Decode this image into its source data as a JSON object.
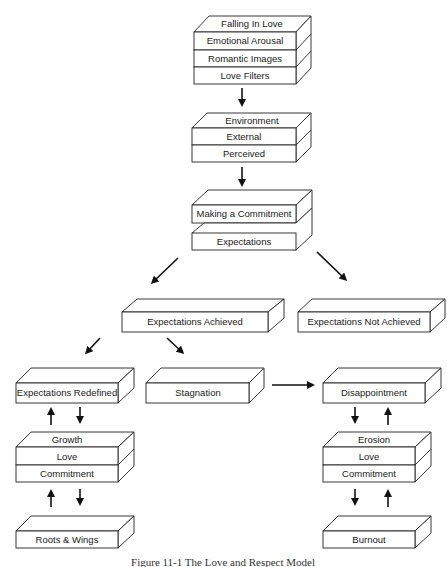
{
  "diagram": {
    "title": "Figure 11-1   The Love and Respect Model",
    "nodes": {
      "falling_in_love": {
        "top": "Falling In Love",
        "rows": [
          "Emotional Arousal",
          "Romantic Images",
          "Love Filters"
        ]
      },
      "environment": {
        "top": "Environment",
        "rows": [
          "External",
          "Perceived"
        ]
      },
      "making_commitment": {
        "label": "Making a Commitment"
      },
      "expectations": {
        "label": "Expectations"
      },
      "expectations_achieved": {
        "label": "Expectations Achieved"
      },
      "expectations_not_achieved": {
        "label": "Expectations Not Achieved"
      },
      "expectations_redefined": {
        "label": "Expectations Redefined"
      },
      "stagnation": {
        "label": "Stagnation"
      },
      "disappointment": {
        "label": "Disappointment"
      },
      "growth_stack": {
        "top": "Growth",
        "rows": [
          "Love",
          "Commitment"
        ]
      },
      "erosion_stack": {
        "top": "Erosion",
        "rows": [
          "Love",
          "Commitment"
        ]
      },
      "roots_wings": {
        "label": "Roots & Wings"
      },
      "burnout": {
        "label": "Burnout"
      }
    },
    "edges": [
      {
        "from": "Falling In Love",
        "to": "Environment"
      },
      {
        "from": "Environment",
        "to": "Making a Commitment"
      },
      {
        "from": "Expectations",
        "to": "Expectations Achieved"
      },
      {
        "from": "Expectations",
        "to": "Expectations Not Achieved"
      },
      {
        "from": "Expectations Achieved",
        "to": "Expectations Redefined"
      },
      {
        "from": "Expectations Achieved",
        "to": "Stagnation"
      },
      {
        "from": "Stagnation",
        "to": "Disappointment"
      },
      {
        "from": "Expectations Redefined",
        "to": "Growth",
        "bidirectional": true
      },
      {
        "from": "Growth",
        "to": "Roots & Wings",
        "bidirectional": true
      },
      {
        "from": "Disappointment",
        "to": "Erosion",
        "bidirectional": true
      },
      {
        "from": "Erosion",
        "to": "Burnout",
        "bidirectional": true
      }
    ]
  }
}
